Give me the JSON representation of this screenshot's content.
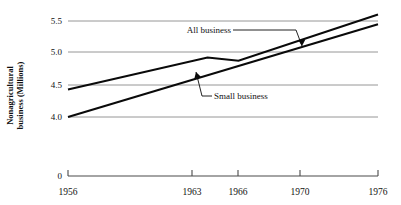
{
  "chart_data": {
    "type": "line",
    "title": "",
    "xlabel": "",
    "ylabel": "Nonagricultural business (Millions)",
    "ylabel_line1": "Nonagricultural",
    "ylabel_line2": "business (Millions)",
    "xlim": [
      1956,
      1976
    ],
    "ylim": [
      4.0,
      5.6
    ],
    "grid": true,
    "legend_position": "inline-annotations",
    "yticks": [
      "0",
      "4.0",
      "4.5",
      "5.0",
      "5.5"
    ],
    "ytick_values": [
      0,
      4.0,
      4.5,
      5.0,
      5.5
    ],
    "axis_break_at_zero": true,
    "xticks": [
      "1956",
      "1963",
      "1966",
      "1970",
      "1976"
    ],
    "xtick_values": [
      1956,
      1963,
      1966,
      1970,
      1976
    ],
    "series": [
      {
        "name": "All business",
        "x": [
          1956,
          1965,
          1967,
          1976
        ],
        "values": [
          4.43,
          4.93,
          4.88,
          5.6
        ]
      },
      {
        "name": "Small business",
        "x": [
          1956,
          1976
        ],
        "values": [
          4.0,
          5.45
        ]
      }
    ],
    "annotations": [
      {
        "text": "All business",
        "target_series": "All business",
        "has_arrow": true
      },
      {
        "text": "Small business",
        "target_series": "All business",
        "has_arrow": true
      }
    ]
  }
}
